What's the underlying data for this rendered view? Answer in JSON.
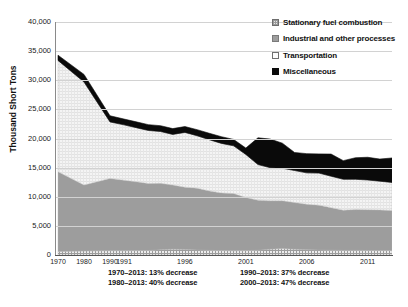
{
  "chart_data": {
    "type": "area",
    "title": "",
    "subtitle": "",
    "xlabel": "",
    "ylabel": "Thousand Short Tons",
    "ylim": [
      0,
      40000
    ],
    "ytick_labels": [
      "40,000",
      "35,000",
      "30,000",
      "25,000",
      "20,000",
      "15,000",
      "10,000",
      "5,000",
      "0"
    ],
    "ytick_values": [
      40000,
      35000,
      30000,
      25000,
      20000,
      15000,
      10000,
      5000,
      0
    ],
    "xtick_labels": [
      "1970",
      "1980",
      "1990",
      "1991",
      "1996",
      "2001",
      "2006",
      "2011"
    ],
    "xtick_values": [
      1970,
      1980,
      1990,
      1991,
      1996,
      2001,
      2006,
      2011
    ],
    "grid": true,
    "legend_position": "top-right",
    "stacked": true,
    "x": [
      1970,
      1980,
      1990,
      1991,
      1992,
      1993,
      1994,
      1995,
      1996,
      1997,
      1998,
      1999,
      2000,
      2001,
      2002,
      2003,
      2004,
      2005,
      2006,
      2007,
      2008,
      2009,
      2010,
      2011,
      2012,
      2013
    ],
    "series": [
      {
        "name": "Stationary fuel combustion",
        "color": "#e8e8e8",
        "pattern": "crosshatch",
        "values": [
          600,
          700,
          750,
          740,
          760,
          780,
          900,
          1000,
          950,
          870,
          800,
          760,
          740,
          760,
          820,
          1000,
          1100,
          1000,
          900,
          860,
          830,
          800,
          800,
          780,
          770,
          760
        ]
      },
      {
        "name": "Industrial and other processes",
        "color": "#9d9d9d",
        "pattern": "solid",
        "values": [
          13700,
          11300,
          12400,
          12100,
          11800,
          11500,
          11400,
          11000,
          10700,
          10600,
          10200,
          9900,
          9800,
          9100,
          8600,
          8300,
          8200,
          8000,
          7800,
          7700,
          7300,
          6900,
          7000,
          7000,
          6950,
          6900
        ]
      },
      {
        "name": "Transportation",
        "color": "#f2f2f2",
        "pattern": "fine-weave",
        "values": [
          19100,
          17700,
          9700,
          9500,
          9300,
          9100,
          8900,
          8700,
          9400,
          9000,
          8800,
          8500,
          8200,
          7400,
          6100,
          5700,
          5600,
          5500,
          5400,
          5500,
          5400,
          5300,
          5200,
          5100,
          4950,
          4800
        ]
      },
      {
        "name": "Miscellaneous",
        "color": "#0a0a0a",
        "pattern": "solid",
        "values": [
          900,
          1300,
          1050,
          1000,
          1000,
          1000,
          1000,
          1000,
          1000,
          1050,
          1100,
          1150,
          1100,
          1100,
          4600,
          4900,
          4300,
          3100,
          3300,
          3300,
          3800,
          3200,
          3700,
          3900,
          3800,
          4200
        ]
      }
    ],
    "annotations": [
      "1970–2013: 13% decrease",
      "1990–2013: 37% decrease",
      "1980–2013: 40% decrease",
      "2000–2013: 47% decrease"
    ]
  },
  "legend": {
    "items": [
      {
        "label": "Stationary fuel combustion",
        "swatch": "crosshatch-swatch"
      },
      {
        "label": "Industrial and other processes",
        "swatch": "gray-swatch"
      },
      {
        "label": "Transportation",
        "swatch": "white-swatch"
      },
      {
        "label": "Miscellaneous",
        "swatch": "black-swatch"
      }
    ]
  },
  "caption": {
    "text": ""
  }
}
